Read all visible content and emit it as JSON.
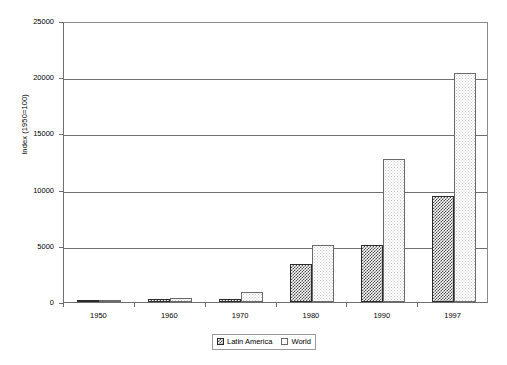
{
  "chart_data": {
    "type": "bar",
    "title": "",
    "subtitle": "",
    "xlabel": "",
    "ylabel": "Index (1950=100)",
    "categories": [
      "1950",
      "1960",
      "1970",
      "1980",
      "1990",
      "1997"
    ],
    "series": [
      {
        "name": "Latin America",
        "values": [
          100,
          270,
          300,
          3400,
          5100,
          9400
        ]
      },
      {
        "name": "World",
        "values": [
          100,
          330,
          900,
          5100,
          12700,
          20400
        ]
      }
    ],
    "ylim": [
      0,
      25000
    ],
    "yticks": [
      0,
      5000,
      10000,
      15000,
      20000,
      25000
    ],
    "ytick_labels": [
      "0",
      "5000",
      "10000",
      "15000",
      "20000",
      "25000"
    ],
    "grid": "horizontal",
    "legend_position": "bottom-center",
    "legend": [
      {
        "label": "Latin America",
        "swatch": "checkered-dark-swatch"
      },
      {
        "label": "World",
        "swatch": "white-outline-swatch"
      }
    ]
  }
}
